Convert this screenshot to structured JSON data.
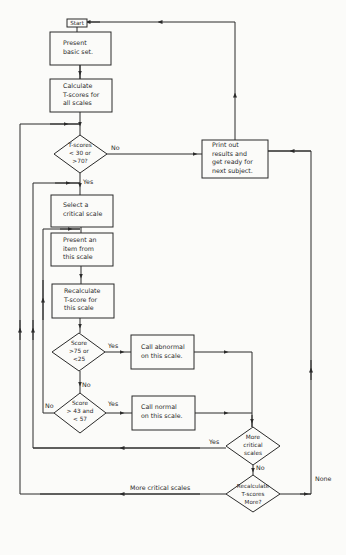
{
  "diagram": {
    "type": "flowchart",
    "nodes": {
      "start": {
        "label": "Start"
      },
      "present_basic": {
        "lines": [
          "Present",
          "basic set."
        ]
      },
      "calc_all": {
        "lines": [
          "Calculate",
          "T-scores for",
          "all scales"
        ]
      },
      "decision_tscores": {
        "lines": [
          "T-scores",
          "< 30 or",
          ">70?"
        ]
      },
      "print_out": {
        "lines": [
          "Print out",
          "results and",
          "get ready for",
          "next subject."
        ]
      },
      "select_scale": {
        "lines": [
          "Select a",
          "critical scale"
        ]
      },
      "present_item": {
        "lines": [
          "Present an",
          "item from",
          "this scale"
        ]
      },
      "recalc_scale": {
        "lines": [
          "Recalculate",
          "T-score for",
          "this scale"
        ]
      },
      "decision_extreme": {
        "lines": [
          "Score",
          ">75 or",
          "<25"
        ]
      },
      "call_abnormal": {
        "lines": [
          "Call abnormal",
          "on this scale."
        ]
      },
      "decision_normal": {
        "lines": [
          "Score",
          "> 43 and",
          "< 57"
        ]
      },
      "call_normal": {
        "lines": [
          "Call normal",
          "on this scale."
        ]
      },
      "decision_more": {
        "lines": [
          "More",
          "critical",
          "scales"
        ]
      },
      "decision_recalc": {
        "lines": [
          "Recalculate",
          "T-scores",
          "More?"
        ]
      }
    },
    "edge_labels": {
      "tscores_no": "No",
      "tscores_yes": "Yes",
      "extreme_yes": "Yes",
      "extreme_no": "No",
      "normal_yes": "Yes",
      "normal_no": "No",
      "more_yes": "Yes",
      "more_no": "No",
      "recalc_more": "More critical scales",
      "recalc_none": "None"
    },
    "colors": {
      "ink": "#2a2a2a",
      "paper": "#fbfbf9"
    }
  }
}
